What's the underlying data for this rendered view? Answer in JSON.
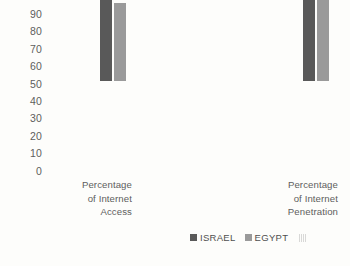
{
  "chart_data": {
    "type": "bar",
    "title": "",
    "subtitle": "",
    "xlabel": "",
    "ylabel": "",
    "ylim": [
      0,
      90
    ],
    "ytick_step": 10,
    "yticks": [
      "90",
      "80",
      "70",
      "60",
      "50",
      "40",
      "30",
      "20",
      "10",
      "0"
    ],
    "grid": false,
    "legend_position": "bottom-right",
    "categories": [
      "Percentage of Internet Access",
      "Percentage of Internet Penetration"
    ],
    "category_label_lines": [
      [
        "Percentage",
        "of Internet",
        "Access"
      ],
      [
        "Percentage",
        "of Internet",
        "Penetration"
      ]
    ],
    "series": [
      {
        "name": "ISRAEL",
        "color": "#595959",
        "values": [
          82,
          80
        ]
      },
      {
        "name": "EGYPT",
        "color": "#9a9a9a",
        "values": [
          45,
          49
        ]
      }
    ],
    "annotations": []
  },
  "legend": {
    "items": [
      {
        "label": "ISRAEL",
        "color": "#595959"
      },
      {
        "label": "EGYPT",
        "color": "#9a9a9a"
      }
    ],
    "artifact_label": ""
  },
  "colors": {
    "background": "#fdfdfb",
    "text": "#5d5d5d",
    "series_israel": "#595959",
    "series_egypt": "#9a9a9a"
  }
}
